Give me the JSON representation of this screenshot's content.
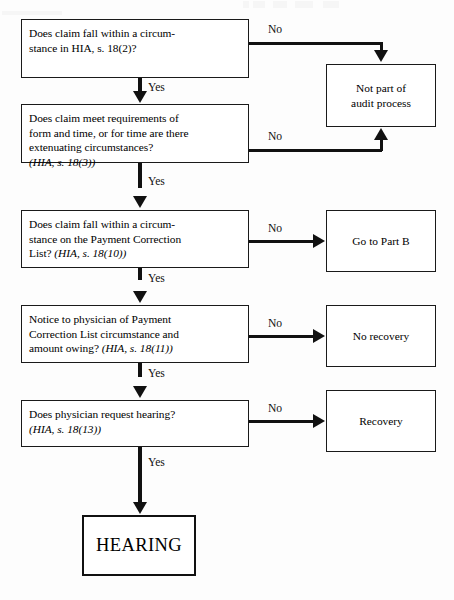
{
  "diagram": {
    "colors": {
      "line": "#111111",
      "box_border": "#1a1a1a",
      "background": "#ffffff",
      "text": "#000000"
    },
    "labels": {
      "yes": "Yes",
      "no": "No"
    },
    "decisions": [
      {
        "id": "d1",
        "lines": [
          {
            "text": "Does claim fall within a circum-",
            "italic": false
          },
          {
            "text": "stance in HIA, s. 18(2)?",
            "italic": false
          }
        ]
      },
      {
        "id": "d2",
        "lines": [
          {
            "text": "Does claim meet requirements of",
            "italic": false
          },
          {
            "text": "form and time, or for time are there",
            "italic": false
          },
          {
            "text": "extenuating circumstances?",
            "italic": false
          },
          {
            "text": "(HIA, s. 18(3))",
            "italic": true
          }
        ]
      },
      {
        "id": "d3",
        "lines": [
          {
            "text": "Does claim fall within a circum-",
            "italic": false
          },
          {
            "text": "stance on the Payment Correction",
            "italic": false
          },
          {
            "text": "List? ",
            "italic": false,
            "tail": "(HIA, s. 18(10))"
          }
        ]
      },
      {
        "id": "d4",
        "lines": [
          {
            "text": "Notice to physician of Payment",
            "italic": false
          },
          {
            "text": "Correction List circumstance and",
            "italic": false
          },
          {
            "text": "amount owing? ",
            "italic": false,
            "tail": "(HIA, s. 18(11))"
          }
        ]
      },
      {
        "id": "d5",
        "lines": [
          {
            "text": "Does physician request hearing?",
            "italic": false
          },
          {
            "text": "(HIA, s. 18(13))",
            "italic": true
          }
        ]
      }
    ],
    "outcomes": [
      {
        "id": "o1",
        "lines": [
          "Not part of",
          "audit process"
        ]
      },
      {
        "id": "o2",
        "lines": [
          "Go to Part B"
        ]
      },
      {
        "id": "o3",
        "lines": [
          "No recovery"
        ]
      },
      {
        "id": "o4",
        "lines": [
          "Recovery"
        ]
      }
    ],
    "terminal": {
      "id": "hearing",
      "label": "HEARING"
    }
  }
}
